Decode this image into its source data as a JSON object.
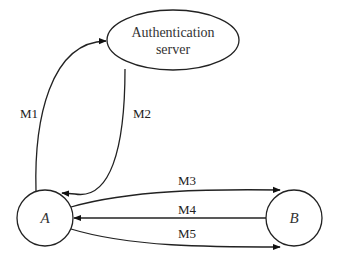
{
  "diagram": {
    "type": "protocol-message-flow",
    "nodes": [
      {
        "id": "auth",
        "label_lines": [
          "Authentication",
          "server"
        ],
        "shape": "ellipse"
      },
      {
        "id": "A",
        "label": "A",
        "shape": "circle"
      },
      {
        "id": "B",
        "label": "B",
        "shape": "circle"
      }
    ],
    "edges": [
      {
        "id": "m1",
        "label": "M1",
        "from": "A",
        "to": "auth"
      },
      {
        "id": "m2",
        "label": "M2",
        "from": "auth",
        "to": "A"
      },
      {
        "id": "m3",
        "label": "M3",
        "from": "A",
        "to": "B"
      },
      {
        "id": "m4",
        "label": "M4",
        "from": "B",
        "to": "A"
      },
      {
        "id": "m5",
        "label": "M5",
        "from": "A",
        "to": "B"
      }
    ],
    "colors": {
      "stroke": "#222222",
      "background": "#ffffff"
    }
  }
}
